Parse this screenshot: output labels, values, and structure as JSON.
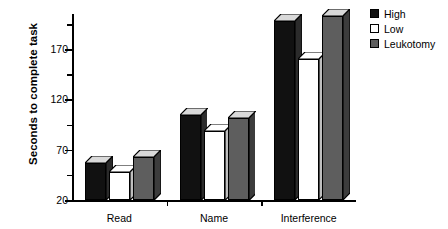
{
  "chart_data": {
    "type": "bar",
    "title": "",
    "xlabel": "",
    "ylabel": "Seconds to complete task",
    "categories": [
      "Read",
      "Name",
      "Interference"
    ],
    "series": [
      {
        "name": "High",
        "color": "#111111",
        "values": [
          57,
          105,
          198
        ]
      },
      {
        "name": "Low",
        "color": "#ffffff",
        "values": [
          48,
          89,
          160
        ]
      },
      {
        "name": "Leukotomy",
        "color": "#5e5e5e",
        "values": [
          63,
          102,
          203
        ]
      }
    ],
    "ylim": [
      20,
      205
    ],
    "yticks": [
      20,
      70,
      120,
      170
    ],
    "ytick_labels": [
      "20",
      "70",
      "120",
      "170"
    ],
    "yminor_ticks": [
      45,
      95,
      145,
      195
    ],
    "grid": false,
    "legend_position": "top-right",
    "style": "3d-bars"
  },
  "legend": {
    "items": [
      {
        "label": "High"
      },
      {
        "label": "Low"
      },
      {
        "label": "Leukotomy"
      }
    ]
  }
}
